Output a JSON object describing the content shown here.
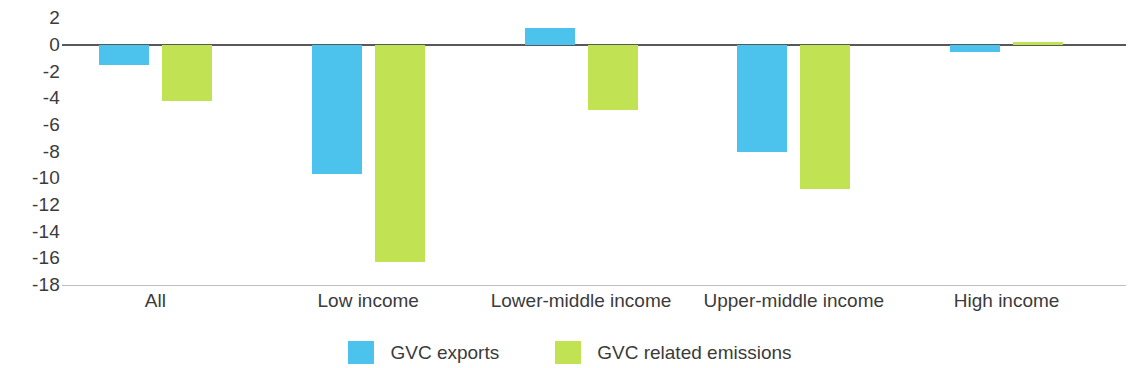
{
  "chart_data": {
    "type": "bar",
    "title": "",
    "subtitle": "",
    "xlabel": "",
    "ylabel": "",
    "grid": false,
    "legend_position": "bottom",
    "orientation": "vertical",
    "grouping": "grouped",
    "categories": [
      "All",
      "Low income",
      "Lower-middle income",
      "Upper-middle income",
      "High income"
    ],
    "ylim": [
      -18,
      2
    ],
    "yticks": [
      2,
      0,
      -2,
      -4,
      -6,
      -8,
      -10,
      -12,
      -14,
      -16,
      -18
    ],
    "ytick_labels": [
      "2",
      "0",
      "-2",
      "-4",
      "-6",
      "-8",
      "-10",
      "-12",
      "-14",
      "-16",
      "-18"
    ],
    "series": [
      {
        "name": "GVC exports",
        "color": "#4cc3ec",
        "values": [
          -1.5,
          -9.7,
          1.3,
          -8.0,
          -0.5
        ]
      },
      {
        "name": "GVC related emissions",
        "color": "#c0e253",
        "values": [
          -4.2,
          -16.3,
          -4.9,
          -10.8,
          0.2
        ]
      }
    ]
  },
  "axis": {
    "zero_line_color": "#58585b",
    "baseline_color": "#bcbec0",
    "tick_text_color": "#3b3b3b"
  },
  "legend": {
    "items": [
      {
        "label": "GVC exports",
        "color": "#4cc3ec"
      },
      {
        "label": "GVC related emissions",
        "color": "#c0e253"
      }
    ]
  }
}
